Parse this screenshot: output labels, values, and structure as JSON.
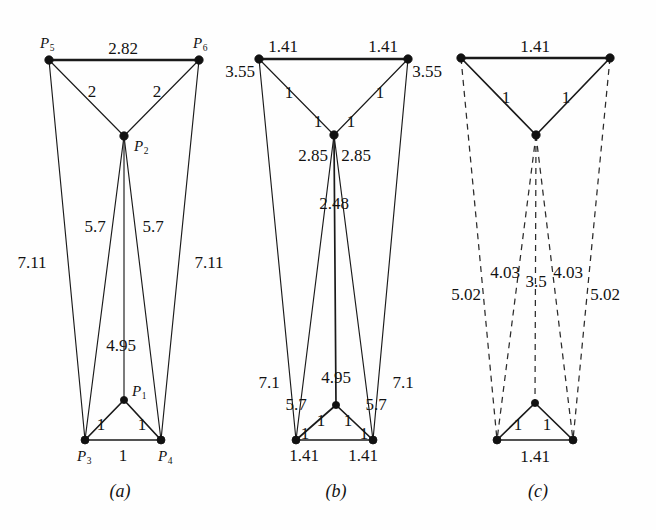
{
  "figure": {
    "background_color": "#fefefe",
    "line_color": "#1a1a1a",
    "node_color": "#111111"
  },
  "panels": [
    {
      "id": "a",
      "caption": "(a)",
      "caption_pos": {
        "x": 120,
        "y": 491
      },
      "nodes": [
        {
          "name": "P1",
          "label": "P",
          "sub": "1",
          "x": 124,
          "y": 400,
          "label_x": 139,
          "label_y": 391,
          "r": 3.6
        },
        {
          "name": "P2",
          "label": "P",
          "sub": "2",
          "x": 124,
          "y": 136,
          "label_x": 141,
          "label_y": 146,
          "r": 4.2
        },
        {
          "name": "P3",
          "label": "P",
          "sub": "3",
          "x": 85,
          "y": 440,
          "label_x": 84,
          "label_y": 456,
          "r": 4.0
        },
        {
          "name": "P4",
          "label": "P",
          "sub": "4",
          "x": 161,
          "y": 440,
          "label_x": 165,
          "label_y": 456,
          "r": 4.0
        },
        {
          "name": "P5",
          "label": "P",
          "sub": "5",
          "x": 49,
          "y": 60,
          "label_x": 47,
          "label_y": 43,
          "r": 4.2
        },
        {
          "name": "P6",
          "label": "P",
          "sub": "6",
          "x": 199,
          "y": 60,
          "label_x": 200,
          "label_y": 43,
          "r": 4.2
        }
      ],
      "edges": [
        {
          "from": "P5",
          "to": "P6",
          "style": "solid",
          "weight": "thick",
          "length": "2.82",
          "label_x": 123,
          "label_y": 48
        },
        {
          "from": "P5",
          "to": "P2",
          "style": "solid",
          "weight": "thin",
          "length": "2",
          "label_x": 92,
          "label_y": 91
        },
        {
          "from": "P6",
          "to": "P2",
          "style": "solid",
          "weight": "thin",
          "length": "2",
          "label_x": 157,
          "label_y": 91
        },
        {
          "from": "P5",
          "to": "P3",
          "style": "solid",
          "weight": "thin",
          "length": "7.11",
          "label_x": 32,
          "label_y": 262
        },
        {
          "from": "P6",
          "to": "P4",
          "style": "solid",
          "weight": "thin",
          "length": "7.11",
          "label_x": 209,
          "label_y": 262
        },
        {
          "from": "P2",
          "to": "P3",
          "style": "solid",
          "weight": "thin",
          "length": "5.7",
          "label_x": 95,
          "label_y": 226
        },
        {
          "from": "P2",
          "to": "P4",
          "style": "solid",
          "weight": "thin",
          "length": "5.7",
          "label_x": 153,
          "label_y": 226
        },
        {
          "from": "P2",
          "to": "P1",
          "style": "solid",
          "weight": "thin",
          "length": "4.95",
          "label_x": 121,
          "label_y": 345
        },
        {
          "from": "P1",
          "to": "P3",
          "style": "solid",
          "weight": "medium",
          "length": "1",
          "label_x": 101,
          "label_y": 424
        },
        {
          "from": "P1",
          "to": "P4",
          "style": "solid",
          "weight": "medium",
          "length": "1",
          "label_x": 142,
          "label_y": 424
        },
        {
          "from": "P3",
          "to": "P4",
          "style": "solid",
          "weight": "medium",
          "length": "1",
          "label_x": 123,
          "label_y": 455
        }
      ]
    },
    {
      "id": "b",
      "caption": "(b)",
      "caption_pos": {
        "x": 336,
        "y": 491
      },
      "nodes": [
        {
          "name": "B1",
          "label": "",
          "sub": "",
          "x": 336,
          "y": 405,
          "label_x": 0,
          "label_y": 0,
          "r": 3.6
        },
        {
          "name": "B2",
          "label": "",
          "sub": "",
          "x": 334,
          "y": 135,
          "label_x": 0,
          "label_y": 0,
          "r": 4.2
        },
        {
          "name": "B3",
          "label": "",
          "sub": "",
          "x": 296,
          "y": 440,
          "label_x": 0,
          "label_y": 0,
          "r": 4.0
        },
        {
          "name": "B4",
          "label": "",
          "sub": "",
          "x": 373,
          "y": 440,
          "label_x": 0,
          "label_y": 0,
          "r": 4.0
        },
        {
          "name": "B5",
          "label": "",
          "sub": "",
          "x": 259,
          "y": 59,
          "label_x": 0,
          "label_y": 0,
          "r": 4.2
        },
        {
          "name": "B6",
          "label": "",
          "sub": "",
          "x": 408,
          "y": 59,
          "label_x": 0,
          "label_y": 0,
          "r": 4.2
        }
      ],
      "edges": [
        {
          "from": "B5",
          "to": "B6",
          "style": "solid",
          "weight": "thick",
          "length": "1.41",
          "label_x": 283,
          "label_y": 46
        },
        {
          "from": "B5",
          "to": "B6",
          "style": "none",
          "weight": "none",
          "length": "1.41",
          "label_x": 383,
          "label_y": 46
        },
        {
          "from": "B5",
          "to": "B3",
          "style": "solid",
          "weight": "thin",
          "length": "3.55",
          "label_x": 240,
          "label_y": 71
        },
        {
          "from": "B6",
          "to": "B4",
          "style": "solid",
          "weight": "thin",
          "length": "3.55",
          "label_x": 427,
          "label_y": 71
        },
        {
          "from": "B5",
          "to": "B2",
          "style": "solid",
          "weight": "thin",
          "length": "1",
          "label_x": 289,
          "label_y": 92
        },
        {
          "from": "B6",
          "to": "B2",
          "style": "solid",
          "weight": "thin",
          "length": "1",
          "label_x": 380,
          "label_y": 92
        },
        {
          "from": "B5",
          "to": "B2",
          "style": "none",
          "weight": "none",
          "length": "1",
          "label_x": 318,
          "label_y": 121
        },
        {
          "from": "B6",
          "to": "B2",
          "style": "none",
          "weight": "none",
          "length": "1",
          "label_x": 351,
          "label_y": 121
        },
        {
          "from": "B2",
          "to": "B3",
          "style": "solid",
          "weight": "thin",
          "length": "2.85",
          "label_x": 313,
          "label_y": 155
        },
        {
          "from": "B2",
          "to": "B4",
          "style": "solid",
          "weight": "thin",
          "length": "2.85",
          "label_x": 356,
          "label_y": 155
        },
        {
          "from": "B2",
          "to": "B1",
          "style": "solid",
          "weight": "medium",
          "length": "2.48",
          "label_x": 334,
          "label_y": 203
        },
        {
          "from": "B5",
          "to": "B3",
          "style": "none",
          "weight": "none",
          "length": "7.1",
          "label_x": 269,
          "label_y": 382
        },
        {
          "from": "B6",
          "to": "B4",
          "style": "none",
          "weight": "none",
          "length": "7.1",
          "label_x": 403,
          "label_y": 382
        },
        {
          "from": "B2",
          "to": "B1",
          "style": "none",
          "weight": "none",
          "length": "4.95",
          "label_x": 336,
          "label_y": 377
        },
        {
          "from": "B2",
          "to": "B3",
          "style": "none",
          "weight": "none",
          "length": "5.7",
          "label_x": 296,
          "label_y": 404
        },
        {
          "from": "B2",
          "to": "B4",
          "style": "none",
          "weight": "none",
          "length": "5.7",
          "label_x": 376,
          "label_y": 404
        },
        {
          "from": "B1",
          "to": "B3",
          "style": "solid",
          "weight": "medium",
          "length": "1",
          "label_x": 321,
          "label_y": 420
        },
        {
          "from": "B1",
          "to": "B4",
          "style": "solid",
          "weight": "medium",
          "length": "1",
          "label_x": 348,
          "label_y": 420
        },
        {
          "from": "B1",
          "to": "B3",
          "style": "none",
          "weight": "none",
          "length": "1",
          "label_x": 305,
          "label_y": 433
        },
        {
          "from": "B1",
          "to": "B4",
          "style": "none",
          "weight": "none",
          "length": "1",
          "label_x": 364,
          "label_y": 433
        },
        {
          "from": "B3",
          "to": "B4",
          "style": "solid",
          "weight": "medium",
          "length": "1.41",
          "label_x": 304,
          "label_y": 455
        },
        {
          "from": "B3",
          "to": "B4",
          "style": "none",
          "weight": "none",
          "length": "1.41",
          "label_x": 363,
          "label_y": 455
        }
      ]
    },
    {
      "id": "c",
      "caption": "(c)",
      "caption_pos": {
        "x": 538,
        "y": 491
      },
      "nodes": [
        {
          "name": "C1",
          "label": "",
          "sub": "",
          "x": 535,
          "y": 403,
          "label_x": 0,
          "label_y": 0,
          "r": 3.6
        },
        {
          "name": "C2",
          "label": "",
          "sub": "",
          "x": 536,
          "y": 135,
          "label_x": 0,
          "label_y": 0,
          "r": 4.2
        },
        {
          "name": "C3",
          "label": "",
          "sub": "",
          "x": 497,
          "y": 440,
          "label_x": 0,
          "label_y": 0,
          "r": 4.0
        },
        {
          "name": "C4",
          "label": "",
          "sub": "",
          "x": 573,
          "y": 440,
          "label_x": 0,
          "label_y": 0,
          "r": 4.0
        },
        {
          "name": "C5",
          "label": "",
          "sub": "",
          "x": 461,
          "y": 58,
          "label_x": 0,
          "label_y": 0,
          "r": 4.2
        },
        {
          "name": "C6",
          "label": "",
          "sub": "",
          "x": 610,
          "y": 58,
          "label_x": 0,
          "label_y": 0,
          "r": 4.2
        }
      ],
      "edges": [
        {
          "from": "C5",
          "to": "C6",
          "style": "solid",
          "weight": "thick",
          "length": "1.41",
          "label_x": 535,
          "label_y": 46
        },
        {
          "from": "C5",
          "to": "C2",
          "style": "solid",
          "weight": "medium",
          "length": "1",
          "label_x": 506,
          "label_y": 97
        },
        {
          "from": "C6",
          "to": "C2",
          "style": "solid",
          "weight": "medium",
          "length": "1",
          "label_x": 566,
          "label_y": 97
        },
        {
          "from": "C5",
          "to": "C3",
          "style": "dashed",
          "weight": "dash",
          "length": "5.02",
          "label_x": 466,
          "label_y": 294
        },
        {
          "from": "C6",
          "to": "C4",
          "style": "dashed",
          "weight": "dash",
          "length": "5.02",
          "label_x": 605,
          "label_y": 294
        },
        {
          "from": "C2",
          "to": "C3",
          "style": "dashed",
          "weight": "dash",
          "length": "4.03",
          "label_x": 505,
          "label_y": 272
        },
        {
          "from": "C2",
          "to": "C4",
          "style": "dashed",
          "weight": "dash",
          "length": "4.03",
          "label_x": 568,
          "label_y": 272
        },
        {
          "from": "C2",
          "to": "C1",
          "style": "dashed",
          "weight": "dash",
          "length": "3.5",
          "label_x": 536,
          "label_y": 281
        },
        {
          "from": "C1",
          "to": "C3",
          "style": "solid",
          "weight": "medium",
          "length": "1",
          "label_x": 518,
          "label_y": 424
        },
        {
          "from": "C1",
          "to": "C4",
          "style": "solid",
          "weight": "medium",
          "length": "1",
          "label_x": 547,
          "label_y": 424
        },
        {
          "from": "C3",
          "to": "C4",
          "style": "solid",
          "weight": "medium",
          "length": "1.41",
          "label_x": 535,
          "label_y": 456
        }
      ]
    }
  ],
  "chart_data": {
    "type": "diagram",
    "panel_a_lengths": [
      "2.82",
      "2",
      "2",
      "7.11",
      "7.11",
      "5.7",
      "5.7",
      "4.95",
      "1",
      "1",
      "1"
    ],
    "panel_b_lengths": [
      "1.41",
      "1.41",
      "3.55",
      "3.55",
      "1",
      "1",
      "1",
      "1",
      "2.85",
      "2.85",
      "2.48",
      "7.1",
      "7.1",
      "4.95",
      "5.7",
      "5.7",
      "1",
      "1",
      "1",
      "1",
      "1.41",
      "1.41"
    ],
    "panel_c_lengths": [
      "1.41",
      "1",
      "1",
      "5.02",
      "5.02",
      "4.03",
      "4.03",
      "3.5",
      "1",
      "1",
      "1.41"
    ],
    "point_labels": [
      "P1",
      "P2",
      "P3",
      "P4",
      "P5",
      "P6"
    ],
    "captions": [
      "(a)",
      "(b)",
      "(c)"
    ]
  }
}
